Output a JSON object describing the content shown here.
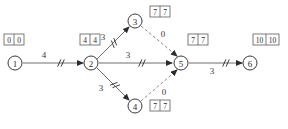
{
  "diagram": {
    "type": "activity-on-arrow-network",
    "nodes": [
      {
        "id": "n1",
        "label": "1",
        "cx": 15,
        "cy": 63,
        "r": 7
      },
      {
        "id": "n2",
        "label": "2",
        "cx": 91,
        "cy": 63,
        "r": 7
      },
      {
        "id": "n3",
        "label": "3",
        "cx": 135,
        "cy": 21,
        "r": 7
      },
      {
        "id": "n4",
        "label": "4",
        "cx": 135,
        "cy": 106,
        "r": 7
      },
      {
        "id": "n5",
        "label": "5",
        "cx": 181,
        "cy": 63,
        "r": 7
      },
      {
        "id": "n6",
        "label": "6",
        "cx": 250,
        "cy": 63,
        "r": 7
      }
    ],
    "edges": [
      {
        "id": "e12",
        "from": "1",
        "to": "2",
        "label": "4",
        "style": "solid",
        "tick": "double",
        "x1": 23,
        "y1": 63,
        "x2": 83,
        "y2": 63,
        "lx": 44,
        "ly": 55,
        "tx": 61,
        "ty": 63
      },
      {
        "id": "e23",
        "from": "2",
        "to": "3",
        "label": "3",
        "style": "solid",
        "tick": "double",
        "x1": 97,
        "y1": 59,
        "x2": 129,
        "y2": 27,
        "lx": 103,
        "ly": 37,
        "tx": 114,
        "ty": 43
      },
      {
        "id": "e25",
        "from": "2",
        "to": "5",
        "label": "3",
        "style": "solid",
        "tick": "double",
        "x1": 99,
        "y1": 63,
        "x2": 172,
        "y2": 63,
        "lx": 128,
        "ly": 55,
        "tx": 142,
        "ty": 63
      },
      {
        "id": "e24",
        "from": "2",
        "to": "4",
        "label": "3",
        "style": "solid",
        "tick": "double",
        "x1": 97,
        "y1": 68,
        "x2": 129,
        "y2": 100,
        "lx": 101,
        "ly": 88,
        "tx": 115,
        "ty": 85
      },
      {
        "id": "e35",
        "from": "3",
        "to": "5",
        "label": "0",
        "style": "dashed",
        "tick": "none",
        "x1": 141,
        "y1": 26,
        "x2": 177,
        "y2": 56,
        "lx": 163,
        "ly": 34,
        "tx": 0,
        "ty": 0
      },
      {
        "id": "e45",
        "from": "4",
        "to": "5",
        "label": "0",
        "style": "dashed",
        "tick": "none",
        "x1": 141,
        "y1": 101,
        "x2": 177,
        "y2": 70,
        "lx": 164,
        "ly": 92,
        "tx": 0,
        "ty": 0
      },
      {
        "id": "e56",
        "from": "5",
        "to": "6",
        "label": "3",
        "style": "solid",
        "tick": "double",
        "x1": 189,
        "y1": 63,
        "x2": 242,
        "y2": 63,
        "lx": 212,
        "ly": 71,
        "tx": 226,
        "ty": 63
      }
    ],
    "time_boxes": [
      {
        "id": "b1",
        "node": "1",
        "early": "0",
        "late": "0",
        "x": 4,
        "y": 34
      },
      {
        "id": "b2",
        "node": "2",
        "early": "4",
        "late": "4",
        "x": 80,
        "y": 34
      },
      {
        "id": "b3",
        "node": "3",
        "early": "7",
        "late": "7",
        "x": 150,
        "y": 6
      },
      {
        "id": "b5",
        "node": "5",
        "early": "7",
        "late": "7",
        "x": 188,
        "y": 34
      },
      {
        "id": "b6",
        "node": "6",
        "early": "10",
        "late": "10",
        "x": 253,
        "y": 34
      },
      {
        "id": "b4",
        "node": "4",
        "early": "7",
        "late": "7",
        "x": 150,
        "y": 100
      }
    ],
    "colors": {
      "background": "#ffffff",
      "edge": "#6e6e6e",
      "edge_dashed": "#8a8a8a",
      "node_stroke": "#3a3a3a",
      "text": "#2b2b2b",
      "box_stroke": "#5a5a5a"
    }
  }
}
